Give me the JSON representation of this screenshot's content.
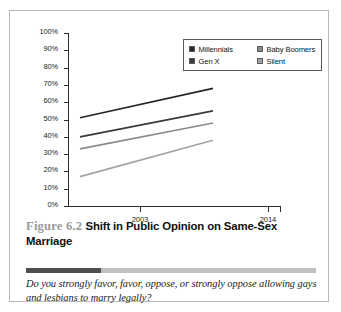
{
  "chart_data": {
    "type": "line",
    "title": "Shift in Public Opinion on Same-Sex Marriage",
    "xlabel": "",
    "ylabel": "Percent favoring gay marriage",
    "x": [
      "2003",
      "2014"
    ],
    "categories": [
      "2003",
      "2014"
    ],
    "ylim": [
      0,
      100
    ],
    "y_ticks": [
      "0%",
      "10%",
      "20%",
      "30%",
      "40%",
      "50%",
      "60%",
      "70%",
      "80%",
      "90%",
      "100%"
    ],
    "y_tick_values": [
      0,
      10,
      20,
      30,
      40,
      50,
      60,
      70,
      80,
      90,
      100
    ],
    "grid": false,
    "legend_position": "top-right",
    "series": [
      {
        "name": "Millennials",
        "values": [
          51,
          68
        ],
        "color": "#262626"
      },
      {
        "name": "Gen X",
        "values": [
          40,
          55
        ],
        "color": "#3a3a3a"
      },
      {
        "name": "Baby Boomers",
        "values": [
          33,
          48
        ],
        "color": "#8a8a8a"
      },
      {
        "name": "Silent",
        "values": [
          17,
          38
        ],
        "color": "#a3a3a3"
      }
    ]
  },
  "legend": {
    "items": [
      {
        "label": "Millennials",
        "swatch": "#262626"
      },
      {
        "label": "Baby Boomers",
        "swatch": "#8a8a8a"
      },
      {
        "label": "Gen X",
        "swatch": "#3a3a3a"
      },
      {
        "label": "Silent",
        "swatch": "#a3a3a3"
      }
    ]
  },
  "axes": {
    "y_title": "Percent favoring gay marriage",
    "y_labels": [
      "100%",
      "90%",
      "80%",
      "70%",
      "60%",
      "50%",
      "40%",
      "30%",
      "20%",
      "10%",
      "0%"
    ],
    "x_labels": [
      "2003",
      "2014"
    ]
  },
  "caption": {
    "figure_number": "Figure 6.2",
    "title": "Shift in Public Opinion on Same-Sex Marriage"
  },
  "footnote": {
    "text": "Do you strongly favor, favor, oppose, or strongly oppose allowing gays and lesbians to marry legally?"
  },
  "colors": {
    "divider_dark": "#4e4e4e",
    "divider_light": "#c0c0c0",
    "axis": "#2b2b2b",
    "card_border": "#b9b9b9"
  }
}
